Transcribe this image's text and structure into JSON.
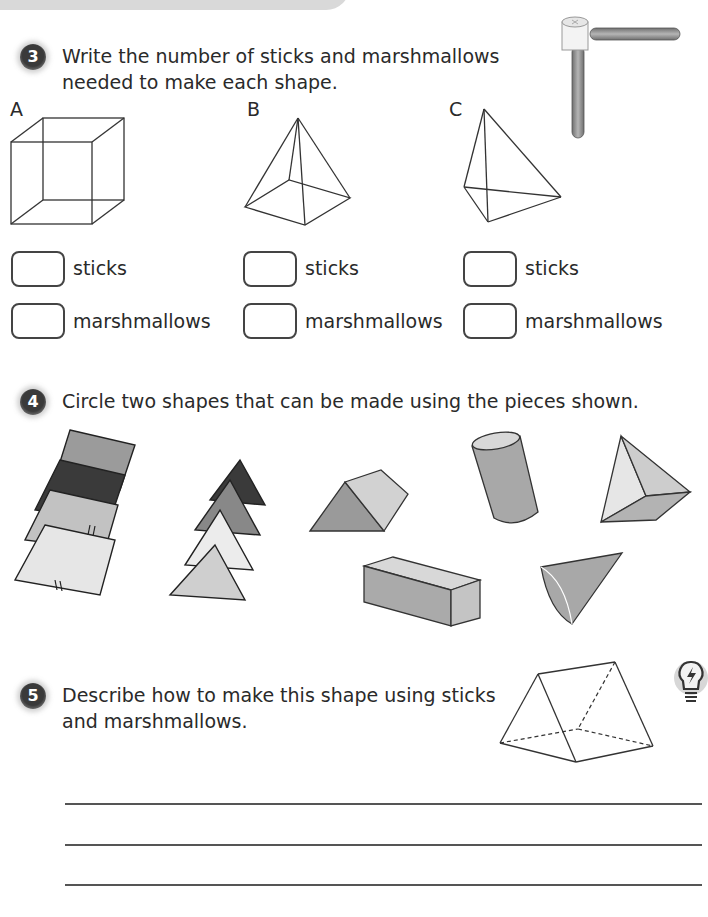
{
  "questions": [
    {
      "number": "3",
      "text_line1": "Write the number of sticks and marshmallows",
      "text_line2": "needed to make each shape.",
      "shapes": [
        {
          "label": "A",
          "shape": "cube",
          "sticks_label": "sticks",
          "marshmallows_label": "marshmallows",
          "sticks_value": "",
          "marshmallows_value": ""
        },
        {
          "label": "B",
          "shape": "square-based pyramid",
          "sticks_label": "sticks",
          "marshmallows_label": "marshmallows",
          "sticks_value": "",
          "marshmallows_value": ""
        },
        {
          "label": "C",
          "shape": "triangular-based pyramid",
          "sticks_label": "sticks",
          "marshmallows_label": "marshmallows",
          "sticks_value": "",
          "marshmallows_value": ""
        }
      ],
      "illustration": "stick-and-marshmallow-icon"
    },
    {
      "number": "4",
      "text": "Circle two shapes that can be made using the pieces shown.",
      "pieces": [
        "square-pieces",
        "triangle-pieces"
      ],
      "options": [
        "triangular-prism",
        "cylinder",
        "tetrahedron",
        "cuboid",
        "cone"
      ]
    },
    {
      "number": "5",
      "text_line1": "Describe how to make this shape using sticks",
      "text_line2": "and marshmallows.",
      "shape": "triangular prism",
      "hint_icon": "lightbulb-icon",
      "answer_lines": [
        "",
        "",
        ""
      ]
    }
  ],
  "colors": {
    "badge": "#3a3a3a",
    "stroke": "#333333",
    "shape_fill_dark": "#9a9a9a",
    "shape_fill_light": "#cfcfcf"
  }
}
